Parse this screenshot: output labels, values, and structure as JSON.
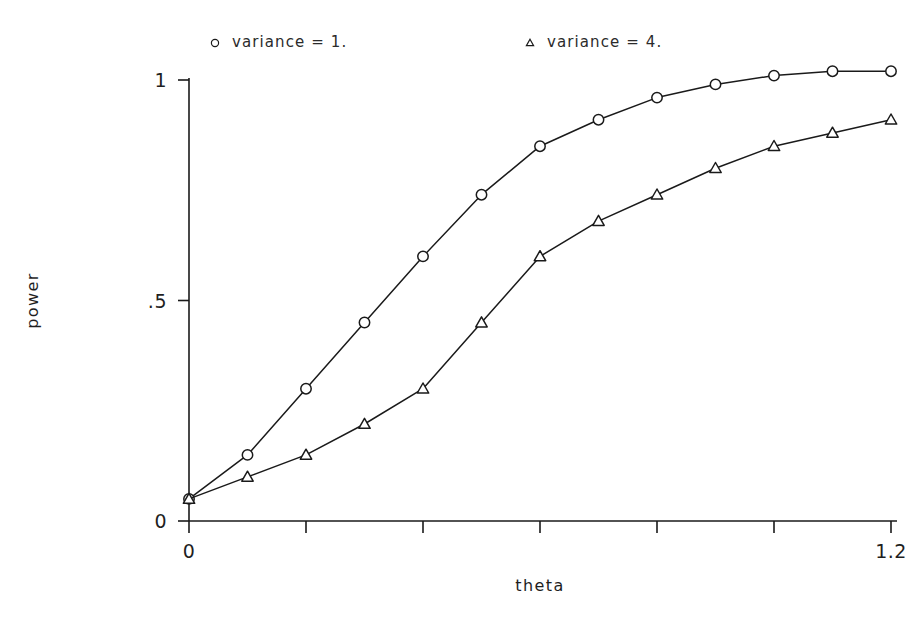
{
  "chart_data": {
    "type": "line",
    "title": "",
    "xlabel": "theta",
    "ylabel": "power",
    "xlim": [
      0,
      1.2
    ],
    "ylim": [
      0,
      1.05
    ],
    "grid": false,
    "legend_position": "top",
    "x": [
      0,
      0.1,
      0.2,
      0.3,
      0.4,
      0.5,
      0.6,
      0.7,
      0.8,
      0.9,
      1.0,
      1.1,
      1.2
    ],
    "series": [
      {
        "name": "variance = 1.",
        "marker": "circle",
        "values": [
          0.05,
          0.15,
          0.3,
          0.45,
          0.6,
          0.74,
          0.85,
          0.91,
          0.96,
          0.99,
          1.01,
          1.02,
          1.02
        ]
      },
      {
        "name": "variance = 4.",
        "marker": "triangle",
        "values": [
          0.05,
          0.1,
          0.15,
          0.22,
          0.3,
          0.45,
          0.6,
          0.68,
          0.74,
          0.8,
          0.85,
          0.88,
          0.91
        ]
      }
    ],
    "x_ticks": [
      {
        "value": 0,
        "label": "0"
      },
      {
        "value": 0.2,
        "label": ""
      },
      {
        "value": 0.4,
        "label": ""
      },
      {
        "value": 0.6,
        "label": ""
      },
      {
        "value": 0.8,
        "label": ""
      },
      {
        "value": 1.0,
        "label": ""
      },
      {
        "value": 1.2,
        "label": "1.2"
      }
    ],
    "y_ticks": [
      {
        "value": 0,
        "label": "0"
      },
      {
        "value": 0.5,
        "label": ".5"
      },
      {
        "value": 1.0,
        "label": "1"
      }
    ],
    "line_color": "#1a1a1a",
    "axis_color": "#1a1a1a",
    "background": "#ffffff"
  },
  "legend": {
    "entries": [
      {
        "marker": "circle-marker",
        "label": "variance  =  1."
      },
      {
        "marker": "triangle-marker",
        "label": "variance  =  4."
      }
    ]
  },
  "axes": {
    "x_title": "theta",
    "y_title": "power",
    "x_tick_labels": [
      "0",
      "1.2"
    ],
    "y_tick_labels": [
      "1",
      ".5",
      "0"
    ]
  }
}
